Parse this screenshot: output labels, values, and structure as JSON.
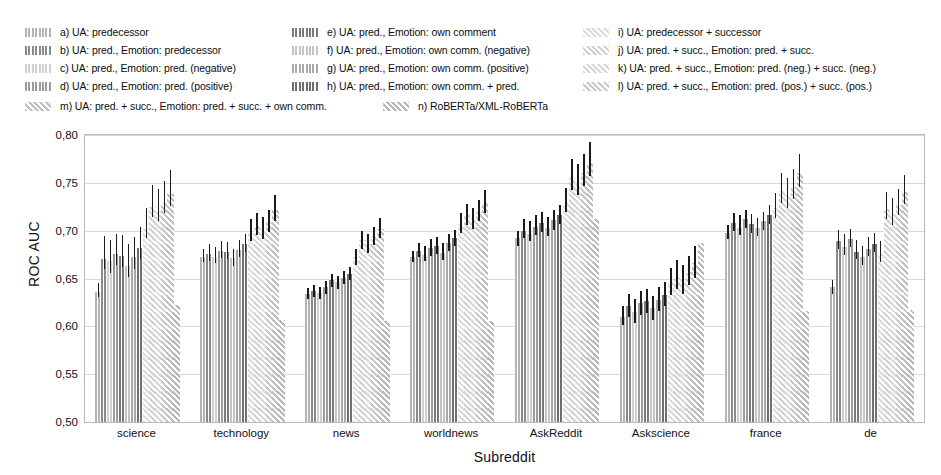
{
  "chart_data": {
    "type": "bar",
    "title": "",
    "subtitle": "",
    "xlabel": "Subreddit",
    "ylabel": "ROC AUC",
    "ylim": [
      0.5,
      0.8
    ],
    "yticks": [
      "0,50",
      "0,55",
      "0,60",
      "0,65",
      "0,70",
      "0,75",
      "0,80"
    ],
    "ytick_values": [
      0.5,
      0.55,
      0.6,
      0.65,
      0.7,
      0.75,
      0.8
    ],
    "grid": true,
    "grid_axis": "y",
    "legend_position": "above-plot",
    "decimal_separator": ",",
    "error_bars": true,
    "categories": [
      "science",
      "technology",
      "news",
      "worldnews",
      "AskReddit",
      "Askscience",
      "france",
      "de"
    ],
    "series": [
      {
        "name": "a",
        "label": "a) UA: predecessor",
        "color": "#b3b3b3",
        "hatch": "vertical",
        "values": [
          0.636,
          0.673,
          0.634,
          0.672,
          0.692,
          0.61,
          0.698,
          0.641
        ],
        "err_low": [
          0.631,
          0.667,
          0.629,
          0.667,
          0.684,
          0.601,
          0.691,
          0.634
        ],
        "err_high": [
          0.645,
          0.681,
          0.64,
          0.679,
          0.7,
          0.621,
          0.706,
          0.648
        ]
      },
      {
        "name": "b",
        "label": "b) UA: pred.,   Emotion: predecessor",
        "color": "#8a8a8a",
        "hatch": "vertical",
        "values": [
          0.67,
          0.676,
          0.637,
          0.679,
          0.7,
          0.621,
          0.708,
          0.689
        ],
        "err_low": [
          0.66,
          0.668,
          0.631,
          0.672,
          0.692,
          0.61,
          0.7,
          0.681
        ],
        "err_high": [
          0.694,
          0.686,
          0.643,
          0.687,
          0.712,
          0.634,
          0.718,
          0.701
        ]
      },
      {
        "name": "c",
        "label": "c) UA: pred.,   Emotion: pred. (negative)",
        "color": "#cfcfcf",
        "hatch": "vertical",
        "values": [
          0.668,
          0.673,
          0.635,
          0.675,
          0.697,
          0.615,
          0.703,
          0.683
        ],
        "err_low": [
          0.656,
          0.666,
          0.629,
          0.668,
          0.689,
          0.603,
          0.695,
          0.675
        ],
        "err_high": [
          0.69,
          0.683,
          0.641,
          0.684,
          0.71,
          0.629,
          0.716,
          0.696
        ]
      },
      {
        "name": "d",
        "label": "d) UA: pred.,   Emotion: pred. (positive)",
        "color": "#9c9c9c",
        "hatch": "vertical",
        "values": [
          0.676,
          0.679,
          0.641,
          0.682,
          0.704,
          0.624,
          0.712,
          0.691
        ],
        "err_low": [
          0.664,
          0.671,
          0.634,
          0.674,
          0.695,
          0.612,
          0.703,
          0.683
        ],
        "err_high": [
          0.697,
          0.689,
          0.647,
          0.691,
          0.716,
          0.637,
          0.722,
          0.702
        ]
      },
      {
        "name": "e",
        "label": "e) UA: pred.,   Emotion: own comment",
        "color": "#7a7a7a",
        "hatch": "vertical",
        "values": [
          0.674,
          0.678,
          0.648,
          0.684,
          0.708,
          0.626,
          0.707,
          0.678
        ],
        "err_low": [
          0.662,
          0.67,
          0.641,
          0.676,
          0.699,
          0.614,
          0.698,
          0.67
        ],
        "err_high": [
          0.695,
          0.688,
          0.655,
          0.693,
          0.719,
          0.639,
          0.717,
          0.69
        ]
      },
      {
        "name": "f",
        "label": "f)  UA: pred.,   Emotion: own comm. (negative)",
        "color": "#c4c4c4",
        "hatch": "vertical",
        "values": [
          0.663,
          0.671,
          0.646,
          0.677,
          0.703,
          0.619,
          0.703,
          0.672
        ],
        "err_low": [
          0.652,
          0.663,
          0.639,
          0.669,
          0.694,
          0.607,
          0.694,
          0.664
        ],
        "err_high": [
          0.686,
          0.681,
          0.653,
          0.687,
          0.714,
          0.632,
          0.713,
          0.684
        ]
      },
      {
        "name": "g",
        "label": "g) UA: pred.,   Emotion: own comm. (positive)",
        "color": "#a8a8a8",
        "hatch": "vertical",
        "values": [
          0.672,
          0.68,
          0.651,
          0.687,
          0.711,
          0.628,
          0.71,
          0.681
        ],
        "err_low": [
          0.66,
          0.672,
          0.644,
          0.679,
          0.701,
          0.616,
          0.701,
          0.673
        ],
        "err_high": [
          0.693,
          0.69,
          0.658,
          0.696,
          0.722,
          0.641,
          0.72,
          0.693
        ]
      },
      {
        "name": "h",
        "label": "h) UA: pred.,   Emotion: own comm. + pred.",
        "color": "#6e6e6e",
        "hatch": "vertical",
        "values": [
          0.682,
          0.686,
          0.655,
          0.692,
          0.716,
          0.633,
          0.716,
          0.686
        ],
        "err_low": [
          0.67,
          0.678,
          0.648,
          0.684,
          0.707,
          0.621,
          0.707,
          0.678
        ],
        "err_high": [
          0.704,
          0.696,
          0.662,
          0.701,
          0.727,
          0.646,
          0.727,
          0.698
        ]
      },
      {
        "name": "i",
        "label": "i)  UA: predecessor + successor",
        "color": "#dcdcdc",
        "hatch": "diagonal",
        "values": [
          0.702,
          0.698,
          0.672,
          0.707,
          0.73,
          0.646,
          0.724,
          0.676
        ],
        "err_low": [
          0.692,
          0.689,
          0.664,
          0.698,
          0.719,
          0.633,
          0.713,
          0.667
        ],
        "err_high": [
          0.724,
          0.712,
          0.681,
          0.718,
          0.745,
          0.661,
          0.739,
          0.689
        ]
      },
      {
        "name": "j",
        "label": "j)  UA: pred. + succ.,   Emotion: pred. + succ.",
        "color": "#d2d2d2",
        "hatch": "diagonal",
        "values": [
          0.725,
          0.705,
          0.69,
          0.716,
          0.755,
          0.653,
          0.742,
          0.723
        ],
        "err_low": [
          0.714,
          0.695,
          0.681,
          0.706,
          0.742,
          0.639,
          0.729,
          0.712
        ],
        "err_high": [
          0.748,
          0.718,
          0.7,
          0.728,
          0.775,
          0.669,
          0.76,
          0.74
        ]
      },
      {
        "name": "k",
        "label": "k) UA: pred. + succ.,   Emotion: pred. (neg.) + succ. (neg.)",
        "color": "#d8d8d8",
        "hatch": "diagonal",
        "values": [
          0.721,
          0.701,
          0.686,
          0.712,
          0.75,
          0.648,
          0.737,
          0.717
        ],
        "err_low": [
          0.71,
          0.691,
          0.677,
          0.702,
          0.737,
          0.634,
          0.724,
          0.706
        ],
        "err_high": [
          0.744,
          0.714,
          0.696,
          0.724,
          0.77,
          0.664,
          0.755,
          0.734
        ]
      },
      {
        "name": "l",
        "label": "l)  UA: pred. + succ.,   Emotion: pred. (pos.) + succ. (pos.)",
        "color": "#cacaca",
        "hatch": "diagonal",
        "values": [
          0.729,
          0.709,
          0.694,
          0.72,
          0.76,
          0.657,
          0.746,
          0.727
        ],
        "err_low": [
          0.718,
          0.699,
          0.685,
          0.71,
          0.747,
          0.643,
          0.733,
          0.716
        ],
        "err_high": [
          0.752,
          0.722,
          0.704,
          0.732,
          0.78,
          0.673,
          0.764,
          0.744
        ]
      },
      {
        "name": "m",
        "label": "m) UA: pred. + succ.,   Emotion: pred. + succ. + own comm.",
        "color": "#c0c0c0",
        "hatch": "diagonal",
        "values": [
          0.738,
          0.722,
          0.702,
          0.729,
          0.771,
          0.666,
          0.76,
          0.74
        ],
        "err_low": [
          0.726,
          0.71,
          0.692,
          0.718,
          0.757,
          0.651,
          0.746,
          0.728
        ],
        "err_high": [
          0.763,
          0.737,
          0.713,
          0.742,
          0.793,
          0.684,
          0.78,
          0.758
        ]
      },
      {
        "name": "n",
        "label": "n) RoBERTa/XML-RoBERTa",
        "color": "#b8b8b8",
        "hatch": "diagonal",
        "values": [
          0.622,
          0.607,
          0.606,
          0.606,
          0.712,
          0.687,
          0.616,
          0.617
        ],
        "err_low": [
          0.622,
          0.607,
          0.606,
          0.606,
          0.712,
          0.687,
          0.616,
          0.617
        ],
        "err_high": [
          0.622,
          0.607,
          0.606,
          0.606,
          0.712,
          0.687,
          0.616,
          0.617
        ]
      }
    ]
  },
  "legend": {
    "columns": 3,
    "items": [
      {
        "key": "a",
        "label": "a) UA: predecessor"
      },
      {
        "key": "b",
        "label": "b) UA: pred.,   Emotion: predecessor"
      },
      {
        "key": "c",
        "label": "c) UA: pred.,   Emotion: pred. (negative)"
      },
      {
        "key": "d",
        "label": "d) UA: pred.,   Emotion: pred. (positive)"
      },
      {
        "key": "e",
        "label": "e) UA: pred.,   Emotion: own comment"
      },
      {
        "key": "f",
        "label": "f)  UA: pred.,   Emotion: own comm. (negative)"
      },
      {
        "key": "g",
        "label": "g) UA: pred.,   Emotion: own comm. (positive)"
      },
      {
        "key": "h",
        "label": "h) UA: pred.,   Emotion: own comm. + pred."
      },
      {
        "key": "i",
        "label": "i) UA: predecessor + successor"
      },
      {
        "key": "j",
        "label": "j) UA: pred. + succ.,   Emotion: pred. + succ."
      },
      {
        "key": "k",
        "label": "k) UA: pred. + succ.,   Emotion: pred. (neg.) + succ. (neg.)"
      },
      {
        "key": "l",
        "label": "l) UA: pred. + succ.,   Emotion: pred. (pos.) + succ. (pos.)"
      },
      {
        "key": "m",
        "label": "m) UA: pred. + succ.,   Emotion: pred. + succ. + own comm."
      },
      {
        "key": "n",
        "label": "n) RoBERTa/XML-RoBERTa"
      }
    ]
  }
}
